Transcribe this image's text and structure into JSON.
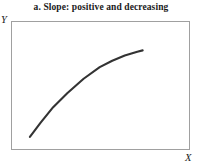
{
  "chart_data": {
    "type": "line",
    "title": "a. Slope: positive and decreasing",
    "xlabel": "X",
    "ylabel": "Y",
    "grid": false,
    "legend": "none",
    "axis_ticks": "none",
    "xlim": [
      0,
      1
    ],
    "ylim": [
      0,
      1
    ],
    "curve_color": "#333333",
    "frame_color": "#a0a0a0",
    "annotation": "Concave-down increasing curve: slope is positive everywhere and becomes smaller as X increases.",
    "series": [
      {
        "name": "positive decreasing slope",
        "x": [
          0.1,
          0.16,
          0.23,
          0.31,
          0.4,
          0.49,
          0.56,
          0.63,
          0.7,
          0.73
        ],
        "y": [
          0.11,
          0.22,
          0.34,
          0.45,
          0.56,
          0.65,
          0.7,
          0.74,
          0.77,
          0.78
        ]
      }
    ]
  },
  "figure": {
    "title": "a. Slope: positive and decreasing",
    "y_label": "Y",
    "x_label": "X"
  }
}
